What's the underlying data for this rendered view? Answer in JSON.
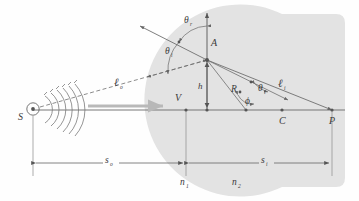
{
  "figure": {
    "name": "refraction-at-spherical-surface",
    "type": "optics-ray-diagram",
    "background_color": "#fefefe",
    "medium_fill_color": "#e2e2e2",
    "line_color": "#555555",
    "ray_color": "#6f6f6f",
    "label_color": "#3a3a3a",
    "beam_arrow_color": "#b8b8b8"
  },
  "labels": {
    "source": "S",
    "point_a": "A",
    "vertex": "V",
    "center": "C",
    "image_point": "P",
    "height": "h",
    "radius": "R",
    "object_distance": "s",
    "object_distance_sub": "o",
    "image_distance": "s",
    "image_distance_sub": "i",
    "index_1": "n",
    "index_1_sub": "1",
    "index_2": "n",
    "index_2_sub": "2",
    "theta_incident": "θ",
    "theta_incident_sub": "i",
    "theta_reflected": "θ",
    "theta_reflected_sub": "r",
    "theta_transmitted": "θ",
    "theta_transmitted_sub": "t",
    "phi": "ϕ",
    "ell_object": "ℓ",
    "ell_object_sub": "o",
    "ell_image": "ℓ",
    "ell_image_sub": "i"
  },
  "geometry": {
    "source_point": {
      "x": 33,
      "y": 110
    },
    "vertex_point": {
      "x": 186,
      "y": 110
    },
    "foot_of_h": {
      "x": 207,
      "y": 110
    },
    "phi_vertex": {
      "x": 246,
      "y": 110
    },
    "center_point": {
      "x": 282,
      "y": 110
    },
    "image_point": {
      "x": 332,
      "y": 110
    },
    "point_a": {
      "x": 207,
      "y": 60
    },
    "normal_top": {
      "x": 207,
      "y": 13
    },
    "reflected_end": {
      "x": 140,
      "y": 26
    },
    "axis_y": 110,
    "dimension_line_y": 163,
    "sphere_center": {
      "x": 282,
      "y": 110
    },
    "sphere_radius": 96
  },
  "wavefronts": {
    "count": 6,
    "description": "concentric arc wavefronts radiating right from S"
  }
}
